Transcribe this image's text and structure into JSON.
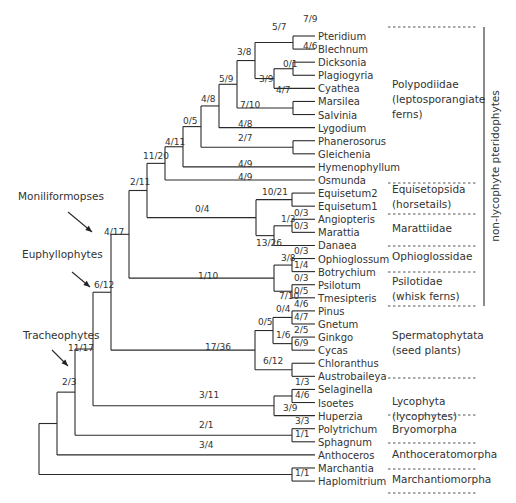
{
  "figure": {
    "type": "phylogenetic-tree",
    "side_label": "non-lycophyte pteridophytes",
    "clade_arrows": [
      {
        "label": "Moniliformopses",
        "x": 18,
        "y": 200,
        "arrow_from": [
          68,
          212
        ],
        "arrow_to": [
          92,
          232
        ]
      },
      {
        "label": "Euphyllophytes",
        "x": 22,
        "y": 258,
        "arrow_from": [
          72,
          272
        ],
        "arrow_to": [
          90,
          287
        ]
      },
      {
        "label": "Tracheophytes",
        "x": 23,
        "y": 339,
        "arrow_from": [
          52,
          350
        ],
        "arrow_to": [
          68,
          366
        ]
      }
    ],
    "row_top": 36,
    "row_step": 13.09,
    "leaf_x": 315,
    "taxa": [
      "Pteridium",
      "Blechnum",
      "Dicksonia",
      "Plagiogyria",
      "Cyathea",
      "Marsilea",
      "Salvinia",
      "Lygodium",
      "Phanerosorus",
      "Gleichenia",
      "Hymenophyllum",
      "Osmunda",
      "Equisetum2",
      "Equisetum1",
      "Angiopteris",
      "Marattia",
      "Danaea",
      "Ophioglossum",
      "Botrychium",
      "Psilotum",
      "Tmesipteris",
      "Pinus",
      "Gnetum",
      "Ginkgo",
      "Cycas",
      "Chloranthus",
      "Austrobaileya",
      "Selaginella",
      "Isoetes",
      "Huperzia",
      "Polytrichum",
      "Sphagnum",
      "Anthoceros",
      "Marchantia",
      "Haplomitrium"
    ],
    "nodes": [
      {
        "id": "n_pb",
        "x": 293,
        "kids": [
          "t0",
          "t1"
        ],
        "sup": "4/6",
        "sup_pos": "inside"
      },
      {
        "id": "n_dp",
        "x": 293,
        "kids": [
          "t2",
          "t3"
        ],
        "sup": "0/1",
        "sup_pos": "above"
      },
      {
        "id": "n_dpc",
        "x": 274,
        "kids": [
          "n_dp",
          "t4"
        ],
        "sup": "4/7",
        "sup_pos": "below"
      },
      {
        "id": "n_ms",
        "x": 293,
        "kids": [
          "t5",
          "t6"
        ],
        "sup": "",
        "sup_pos": "none"
      },
      {
        "id": "n_pgl",
        "x": 293,
        "kids": [
          "t8",
          "t9"
        ],
        "sup": "",
        "sup_pos": "none"
      },
      {
        "id": "n_top",
        "x": 255,
        "kids": [
          "n_pb",
          "n_dpc"
        ],
        "sup": "3/9",
        "sup_pos": "below-left"
      },
      {
        "id": "n_38",
        "x": 237,
        "kids": [
          "n_top",
          "n_ms"
        ],
        "sup": "3/8",
        "sup_pos": "above"
      },
      {
        "id": "n_59",
        "x": 219,
        "kids": [
          "n_38",
          "t7"
        ],
        "sup": "5/9",
        "sup_pos": "above"
      },
      {
        "id": "n_48",
        "x": 201,
        "kids": [
          "n_59",
          "n_pgl"
        ],
        "sup": "4/8",
        "sup_pos": "above"
      },
      {
        "id": "n_05",
        "x": 183,
        "kids": [
          "n_48",
          "t10"
        ],
        "sup": "0/5",
        "sup_pos": "above"
      },
      {
        "id": "n_411",
        "x": 165,
        "kids": [
          "n_05",
          "t11"
        ],
        "sup": "4/11",
        "sup_pos": "above"
      },
      {
        "id": "n_eq",
        "x": 292,
        "kids": [
          "t12",
          "t13"
        ],
        "sup": "",
        "sup_pos": "none"
      },
      {
        "id": "n_am",
        "x": 292,
        "kids": [
          "t14",
          "t15"
        ],
        "sup": "0/3",
        "sup_pos": "inside"
      },
      {
        "id": "n_amd",
        "x": 274,
        "kids": [
          "n_am",
          "t16"
        ],
        "sup": "1/3",
        "sup_pos": "above"
      },
      {
        "id": "n_mar",
        "x": 256,
        "kids": [
          "n_eq",
          "n_amd"
        ],
        "sup": "13/26",
        "sup_pos": "below-left"
      },
      {
        "id": "n_ob",
        "x": 292,
        "kids": [
          "t17",
          "t18"
        ],
        "sup": "1/4",
        "sup_pos": "inside"
      },
      {
        "id": "n_pt",
        "x": 292,
        "kids": [
          "t19",
          "t20"
        ],
        "sup": "0/5",
        "sup_pos": "inside"
      },
      {
        "id": "n_opp",
        "x": 274,
        "kids": [
          "n_ob",
          "n_pt"
        ],
        "sup": "3/8",
        "sup_pos": "above"
      },
      {
        "id": "n_pg",
        "x": 292,
        "kids": [
          "t21",
          "t22"
        ],
        "sup": "4/7",
        "sup_pos": "inside"
      },
      {
        "id": "n_gc",
        "x": 292,
        "kids": [
          "t23",
          "t24"
        ],
        "sup": "6/9",
        "sup_pos": "inside"
      },
      {
        "id": "n_pggc",
        "x": 273,
        "kids": [
          "n_pg",
          "n_gc"
        ],
        "sup": "0/4",
        "sup_pos": "above"
      },
      {
        "id": "n_ca",
        "x": 292,
        "kids": [
          "t25",
          "t26"
        ],
        "sup": "",
        "sup_pos": "none"
      },
      {
        "id": "n_seed",
        "x": 255,
        "kids": [
          "n_pggc",
          "n_ca"
        ],
        "sup": "0/5",
        "sup_pos": "above"
      },
      {
        "id": "n_si",
        "x": 292,
        "kids": [
          "t27",
          "t28"
        ],
        "sup": "4/6",
        "sup_pos": "inside"
      },
      {
        "id": "n_lyc",
        "x": 274,
        "kids": [
          "n_si",
          "t29"
        ],
        "sup": "3/9",
        "sup_pos": "below-left"
      },
      {
        "id": "n_bry",
        "x": 292,
        "kids": [
          "t30",
          "t31"
        ],
        "sup": "1/1",
        "sup_pos": "inside"
      },
      {
        "id": "n_mh",
        "x": 292,
        "kids": [
          "t33",
          "t34"
        ],
        "sup": "1/1",
        "sup_pos": "inside"
      },
      {
        "id": "n_1120",
        "x": 147,
        "kids": [
          "n_411",
          "n_mar_stem"
        ],
        "sup": "11/20",
        "sup_pos": "above"
      },
      {
        "id": "n_mar_stem",
        "x": 147,
        "kids": [],
        "sup": "",
        "sup_pos": "none"
      }
    ],
    "branch_labels": [
      {
        "text": "7/9",
        "x": 303,
        "y": 22
      },
      {
        "text": "5/7",
        "x": 272,
        "y": 30
      },
      {
        "text": "4/6",
        "x": 303,
        "y": 49
      },
      {
        "text": "3/8",
        "x": 237,
        "y": 55
      },
      {
        "text": "0/1",
        "x": 283,
        "y": 67
      },
      {
        "text": "3/9",
        "x": 259,
        "y": 82
      },
      {
        "text": "5/9",
        "x": 219,
        "y": 82
      },
      {
        "text": "4/7",
        "x": 276,
        "y": 93
      },
      {
        "text": "4/8",
        "x": 201,
        "y": 102
      },
      {
        "text": "7/10",
        "x": 240,
        "y": 108
      },
      {
        "text": "0/5",
        "x": 183,
        "y": 124
      },
      {
        "text": "4/8",
        "x": 238,
        "y": 127
      },
      {
        "text": "2/7",
        "x": 238,
        "y": 141
      },
      {
        "text": "4/11",
        "x": 165,
        "y": 145
      },
      {
        "text": "11/20",
        "x": 143,
        "y": 159
      },
      {
        "text": "4/9",
        "x": 238,
        "y": 167
      },
      {
        "text": "4/9",
        "x": 238,
        "y": 180
      },
      {
        "text": "2/11",
        "x": 130,
        "y": 185
      },
      {
        "text": "10/21",
        "x": 262,
        "y": 195
      },
      {
        "text": "0/4",
        "x": 195,
        "y": 212
      },
      {
        "text": "0/3",
        "x": 294,
        "y": 216
      },
      {
        "text": "1/3",
        "x": 281,
        "y": 222
      },
      {
        "text": "0/3",
        "x": 294,
        "y": 229
      },
      {
        "text": "4/17",
        "x": 104,
        "y": 235
      },
      {
        "text": "13/26",
        "x": 256,
        "y": 246
      },
      {
        "text": "0/3",
        "x": 294,
        "y": 254
      },
      {
        "text": "3/8",
        "x": 281,
        "y": 261
      },
      {
        "text": "1/4",
        "x": 294,
        "y": 268
      },
      {
        "text": "0/3",
        "x": 294,
        "y": 281
      },
      {
        "text": "1/10",
        "x": 198,
        "y": 279
      },
      {
        "text": "0/5",
        "x": 294,
        "y": 294
      },
      {
        "text": "7/10",
        "x": 279,
        "y": 299
      },
      {
        "text": "4/6",
        "x": 294,
        "y": 307
      },
      {
        "text": "0/4",
        "x": 276,
        "y": 312
      },
      {
        "text": "6/12",
        "x": 94,
        "y": 288
      },
      {
        "text": "4/7",
        "x": 294,
        "y": 320
      },
      {
        "text": "0/5",
        "x": 258,
        "y": 325
      },
      {
        "text": "2/5",
        "x": 294,
        "y": 333
      },
      {
        "text": "1/6",
        "x": 276,
        "y": 338
      },
      {
        "text": "6/9",
        "x": 294,
        "y": 346
      },
      {
        "text": "17/36",
        "x": 205,
        "y": 350
      },
      {
        "text": "11/17",
        "x": 68,
        "y": 351
      },
      {
        "text": "6/12",
        "x": 263,
        "y": 364
      },
      {
        "text": "1/3",
        "x": 295,
        "y": 385
      },
      {
        "text": "4/6",
        "x": 295,
        "y": 398
      },
      {
        "text": "2/3",
        "x": 62,
        "y": 385
      },
      {
        "text": "3/11",
        "x": 199,
        "y": 398
      },
      {
        "text": "3/9",
        "x": 283,
        "y": 411
      },
      {
        "text": "3/3",
        "x": 295,
        "y": 424
      },
      {
        "text": "2/1",
        "x": 199,
        "y": 428
      },
      {
        "text": "1/1",
        "x": 295,
        "y": 437
      },
      {
        "text": "3/4",
        "x": 199,
        "y": 448
      },
      {
        "text": "1/1",
        "x": 295,
        "y": 476
      }
    ],
    "groups": [
      {
        "lines": [
          "Polypodiidae",
          "(leptosporangiate",
          "  ferns)"
        ],
        "x": 392,
        "y": 88,
        "dash_top": 27,
        "dash_bottom": null
      },
      {
        "lines": [
          "Equisetopsida",
          "(horsetails)"
        ],
        "x": 392,
        "y": 193,
        "dash_top": 183,
        "dash_bottom": 214
      },
      {
        "lines": [
          "Marattiidae"
        ],
        "x": 392,
        "y": 232,
        "dash_top": null,
        "dash_bottom": 246
      },
      {
        "lines": [
          "Ophioglossidae"
        ],
        "x": 392,
        "y": 260,
        "dash_top": null,
        "dash_bottom": 272
      },
      {
        "lines": [
          "Psilotidae",
          "(whisk ferns)"
        ],
        "x": 392,
        "y": 285,
        "dash_top": null,
        "dash_bottom": 306
      },
      {
        "lines": [
          "Spermatophytata",
          "(seed plants)"
        ],
        "x": 392,
        "y": 339,
        "dash_top": null,
        "dash_bottom": null
      },
      {
        "lines": [
          "Lycophyta",
          "(lycophytes)"
        ],
        "x": 392,
        "y": 405,
        "dash_top": 378,
        "dash_bottom": 415
      },
      {
        "lines": [
          "Bryomorpha"
        ],
        "x": 392,
        "y": 433,
        "dash_top": null,
        "dash_bottom": 443
      },
      {
        "lines": [
          "Anthoceratomorpha"
        ],
        "x": 392,
        "y": 458,
        "dash_top": null,
        "dash_bottom": 469
      },
      {
        "lines": [
          "Marchantiomorpha"
        ],
        "x": 392,
        "y": 483,
        "dash_top": null,
        "dash_bottom": 493
      }
    ]
  }
}
